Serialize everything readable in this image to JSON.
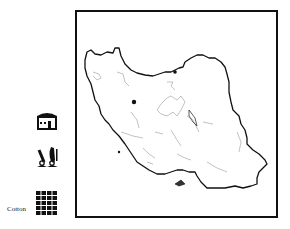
{
  "legend": {
    "items": [
      {
        "icon": "house-icon",
        "label": ""
      },
      {
        "icon": "scissors-icon",
        "label": ""
      },
      {
        "icon": "grid-icon",
        "label": "Cotton"
      }
    ]
  },
  "map": {
    "region": "Iran",
    "markers": [
      {
        "name": "city-marker",
        "x": 57,
        "y": 90
      },
      {
        "name": "city-marker",
        "x": 98,
        "y": 60
      }
    ],
    "colors": {
      "border": "#111111",
      "rivers": "#999999",
      "background": "#ffffff"
    }
  }
}
